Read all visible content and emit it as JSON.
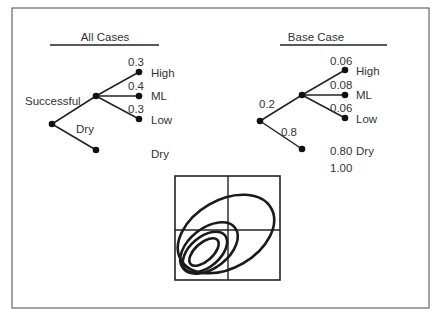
{
  "panels": {
    "all_cases": {
      "title": "All Cases",
      "root_branch_label": "Successful",
      "dry_branch_label": "Dry",
      "outcomes": [
        {
          "prob": "0.3",
          "label": "High"
        },
        {
          "prob": "0.4",
          "label": "ML"
        },
        {
          "prob": "0.3",
          "label": "Low"
        }
      ],
      "dry_outcome_label": "Dry"
    },
    "base_case": {
      "title": "Base Case",
      "success_prob": "0.2",
      "dry_prob": "0.8",
      "outcomes": [
        {
          "prob": "0.06",
          "label": "High"
        },
        {
          "prob": "0.08",
          "label": "ML"
        },
        {
          "prob": "0.06",
          "label": "Low"
        }
      ],
      "dry_outcome": {
        "prob": "0.80",
        "label": "Dry"
      },
      "total": "1.00"
    }
  },
  "contour_plot": {
    "grid": "2x2",
    "contours": 4
  }
}
